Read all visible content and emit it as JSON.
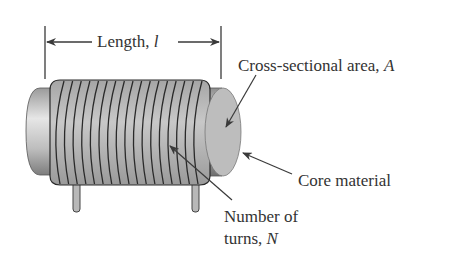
{
  "diagram": {
    "labels": {
      "length": {
        "text": "Length, ",
        "symbol": "l"
      },
      "area": {
        "text": "Cross-sectional area, ",
        "symbol": "A"
      },
      "core": {
        "text": "Core material"
      },
      "turns_line1": {
        "text": "Number of"
      },
      "turns_line2": {
        "text": "turns, ",
        "symbol": "N"
      }
    },
    "coil_turns_drawn": 17,
    "colors": {
      "line": "#3a3a3a",
      "text": "#333333",
      "core_face": "#bdbdbd",
      "core_body": "#a8a8a8",
      "wire": "#b5b5b5",
      "wire_outline": "#2a2a2a",
      "background": "#ffffff"
    }
  }
}
